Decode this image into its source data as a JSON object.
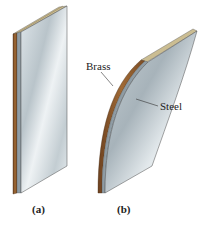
{
  "figure": {
    "panels": [
      {
        "id": "a",
        "caption": "(a)",
        "state": "flat"
      },
      {
        "id": "b",
        "caption": "(b)",
        "state": "bent"
      }
    ],
    "labels": {
      "brass": "Brass",
      "steel": "Steel"
    },
    "colors": {
      "brass_edge": "#8a5a2b",
      "brass_top": "#c8b88a",
      "steel_light": "#e8edf0",
      "steel_dark": "#a9b4bb",
      "steel_edge": "#7d8a92",
      "outline": "#3a3a3a",
      "text": "#222222"
    }
  }
}
